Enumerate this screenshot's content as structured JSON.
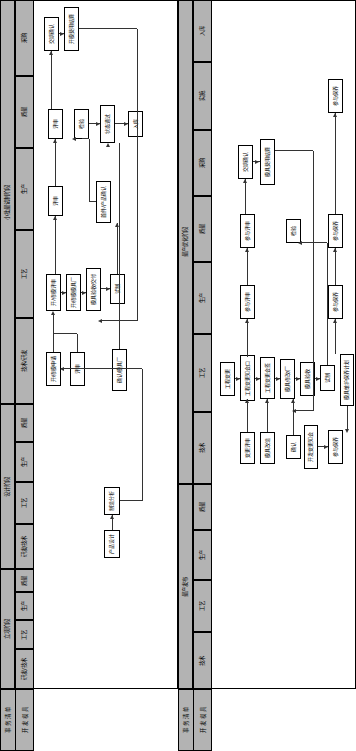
{
  "page": {
    "orientation": "rotated-90",
    "width": 356,
    "height": 751,
    "background": "#ffffff",
    "header_fill": "#b3b3b3",
    "line_color": "#000000"
  },
  "diagrams": [
    {
      "id": "diagram-top",
      "corner_label_title": "事 务 清 单",
      "corner_label_row": "开 发 模 具",
      "phases": [
        {
          "label": "立项阶段",
          "lanes": [
            "研发/技术",
            "工艺",
            "生产",
            "质量"
          ]
        },
        {
          "label": "设计阶段",
          "lanes": [
            "研发/技术",
            "工艺",
            "生产",
            "质量"
          ]
        },
        {
          "label": "小批量试制阶段",
          "lanes": [
            "技术/研发",
            "工艺",
            "生产",
            "质量",
            "采购"
          ]
        }
      ],
      "nodes": [
        {
          "id": "n1",
          "label": "产品设计",
          "lane": "设计阶段/研发/技术"
        },
        {
          "id": "n2",
          "label": "制造分析",
          "lane": "设计阶段/工艺"
        },
        {
          "id": "n3",
          "label": "开/修模申请",
          "lane": "小批量试制阶段/技术/研发"
        },
        {
          "id": "n4",
          "label": "评审",
          "lane": "小批量试制阶段/技术/研发"
        },
        {
          "id": "n5",
          "label": "开/修模评审",
          "lane": "小批量试制阶段/工艺"
        },
        {
          "id": "n6",
          "label": "开/修模模具厂",
          "lane": "小批量试制阶段/工艺"
        },
        {
          "id": "n7",
          "label": "模具验收/交付",
          "lane": "小批量试制阶段/工艺"
        },
        {
          "id": "n8",
          "label": "试制",
          "lane": "小批量试制阶段/工艺"
        },
        {
          "id": "n9",
          "label": "评审",
          "lane": "小批量试制阶段/生产"
        },
        {
          "id": "n10",
          "label": "首件/产品确认",
          "lane": "小批量试制阶段/生产"
        },
        {
          "id": "n11",
          "label": "评审",
          "lane": "小批量试制阶段/质量"
        },
        {
          "id": "n12",
          "label": "检验",
          "lane": "小批量试制阶段/质量"
        },
        {
          "id": "n13",
          "label": "状态通过",
          "lane": "小批量试制阶段/质量"
        },
        {
          "id": "n14",
          "label": "入库",
          "lane": "小批量试制阶段/质量"
        },
        {
          "id": "n15",
          "label": "交期确认",
          "lane": "小批量试制阶段/采购"
        },
        {
          "id": "n16",
          "label": "开模费用结算",
          "lane": "小批量试制阶段/采购"
        },
        {
          "id": "n17",
          "label": "确认/模具厂",
          "lane": "小批量试制阶段/技术/研发"
        }
      ]
    },
    {
      "id": "diagram-bottom",
      "corner_label_title": "事 务 清 单",
      "corner_label_row": "开 发 模 具",
      "phases": [
        {
          "label": "量产发布",
          "lanes": [
            "技术",
            "工艺",
            "生产",
            "质量"
          ]
        },
        {
          "label": "量产优化阶段",
          "lanes": [
            "技术",
            "工艺",
            "生产",
            "质量",
            "采购",
            "实施",
            "入库"
          ]
        }
      ],
      "nodes": [
        {
          "id": "m1",
          "label": "工程变更",
          "lane": "量产优化阶段/工艺"
        },
        {
          "id": "m2",
          "label": "工程变更知会口",
          "lane": "量产优化阶段/工艺"
        },
        {
          "id": "m3",
          "label": "工程变更会签",
          "lane": "量产优化阶段/工艺"
        },
        {
          "id": "m4",
          "label": "模具修改/厂",
          "lane": "量产优化阶段/工艺"
        },
        {
          "id": "m5",
          "label": "模具验收",
          "lane": "量产优化阶段/工艺"
        },
        {
          "id": "m6",
          "label": "试制",
          "lane": "量产优化阶段/工艺"
        },
        {
          "id": "m7",
          "label": "模具维护保养计划",
          "lane": "量产优化阶段/工艺"
        },
        {
          "id": "m8",
          "label": "模具保养执行",
          "lane": "量产优化阶段/工艺"
        },
        {
          "id": "m9",
          "label": "变更评审",
          "lane": "量产优化阶段/技术"
        },
        {
          "id": "m10",
          "label": "模具改造",
          "lane": "量产优化阶段/技术"
        },
        {
          "id": "m11",
          "label": "确认",
          "lane": "量产优化阶段/技术"
        },
        {
          "id": "m12",
          "label": "开发变更知会",
          "lane": "量产优化阶段/技术"
        },
        {
          "id": "m13",
          "label": "参与保养",
          "lane": "量产优化阶段/技术"
        },
        {
          "id": "m14",
          "label": "参与评审",
          "lane": "量产优化阶段/生产"
        },
        {
          "id": "m15",
          "label": "参与保养",
          "lane": "量产优化阶段/生产"
        },
        {
          "id": "m16",
          "label": "参与评审",
          "lane": "量产优化阶段/质量"
        },
        {
          "id": "m17",
          "label": "检验",
          "lane": "量产优化阶段/质量"
        },
        {
          "id": "m18",
          "label": "参与保养",
          "lane": "量产优化阶段/质量"
        },
        {
          "id": "m19",
          "label": "交期确认",
          "lane": "量产优化阶段/采购"
        },
        {
          "id": "m20",
          "label": "模具费用结算",
          "lane": "量产优化阶段/采购"
        },
        {
          "id": "m21",
          "label": "参与保养",
          "lane": "量产优化阶段/实施"
        }
      ]
    }
  ]
}
